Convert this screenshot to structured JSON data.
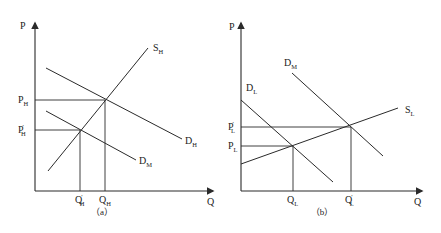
{
  "diagram": {
    "line_color": "#2a2a2a",
    "panels": [
      {
        "id": "a",
        "caption": "（a）",
        "axis": {
          "y_label": "P",
          "x_label": "Q"
        },
        "curves": [
          {
            "name": "S",
            "sub": "H",
            "type": "supply"
          },
          {
            "name": "D",
            "sub": "H",
            "type": "demand"
          },
          {
            "name": "D",
            "sub": "M",
            "type": "demand"
          }
        ],
        "price_levels": [
          {
            "name": "P",
            "sub": "H",
            "prime": false
          },
          {
            "name": "P",
            "sub": "H",
            "prime": true
          }
        ],
        "quantity_levels": [
          {
            "name": "Q",
            "sub": "H",
            "prime": true
          },
          {
            "name": "Q",
            "sub": "H",
            "prime": false
          }
        ]
      },
      {
        "id": "b",
        "caption": "（b）",
        "axis": {
          "y_label": "P",
          "x_label": "Q"
        },
        "curves": [
          {
            "name": "D",
            "sub": "M",
            "type": "demand"
          },
          {
            "name": "D",
            "sub": "L",
            "type": "demand"
          },
          {
            "name": "S",
            "sub": "L",
            "type": "supply"
          }
        ],
        "price_levels": [
          {
            "name": "P",
            "sub": "L",
            "prime": true
          },
          {
            "name": "P",
            "sub": "L",
            "prime": false
          }
        ],
        "quantity_levels": [
          {
            "name": "Q",
            "sub": "L",
            "prime": false
          },
          {
            "name": "Q",
            "sub": "L",
            "prime": true
          }
        ]
      }
    ],
    "prime_mark": "′"
  }
}
